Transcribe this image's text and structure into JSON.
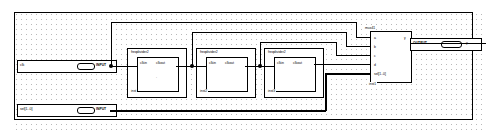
{
  "document": {
    "type": "block-diagram-schematic",
    "title": "Frequency divider chain with 4-to-1 multiplexer"
  },
  "canvas": {
    "background_color": "#ffffff",
    "grid_dot_color": "#b9b9b9",
    "sheet_border_color": "#000000",
    "wire_color": "#000000"
  },
  "ports": {
    "inputs": [
      {
        "name": "clk",
        "kind": "INPUT",
        "bus": false
      },
      {
        "name": "sel[1..0]",
        "kind": "INPUT",
        "bus": true
      }
    ],
    "outputs": [
      {
        "name": "y",
        "kind": "OUTPUT",
        "bus": false
      }
    ]
  },
  "modules": [
    {
      "title": "freqdivider2",
      "instance": "inst",
      "pins_in": [
        "clkin"
      ],
      "pins_out": [
        "clkout"
      ]
    },
    {
      "title": "freqdivider2",
      "instance": "inst2",
      "pins_in": [
        "clkin"
      ],
      "pins_out": [
        "clkout"
      ]
    },
    {
      "title": "freqdivider2",
      "instance": "inst3",
      "pins_in": [
        "clkin"
      ],
      "pins_out": [
        "clkout"
      ]
    }
  ],
  "mux": {
    "title": "mux41",
    "instance": "inst1",
    "pins_in": [
      "a",
      "b",
      "c",
      "d",
      "sel[1..0]"
    ],
    "pins_out": [
      "y"
    ]
  }
}
